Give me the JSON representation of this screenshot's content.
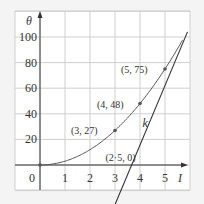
{
  "chart_data": {
    "type": "line",
    "title": "",
    "xlabel": "I",
    "ylabel": "θ",
    "xlim": [
      -1,
      6
    ],
    "ylim": [
      -20,
      120
    ],
    "grid": true,
    "x_ticks": [
      "0",
      "1",
      "2",
      "3",
      "4",
      "5"
    ],
    "y_ticks": [
      "20",
      "40",
      "60",
      "80",
      "100"
    ],
    "series": [
      {
        "name": "curve",
        "kind": "quadratic",
        "x": [
          0,
          3,
          4,
          5
        ],
        "y": [
          0,
          27,
          48,
          75
        ]
      },
      {
        "name": "tangent",
        "kind": "line",
        "x": [
          2.5,
          6.0
        ],
        "y": [
          0,
          104
        ]
      }
    ],
    "annotations": [
      {
        "text": "(3, 27)",
        "x": 3,
        "y": 27
      },
      {
        "text": "(4, 48)",
        "x": 4,
        "y": 48
      },
      {
        "text": "(5, 75)",
        "x": 5,
        "y": 75
      },
      {
        "text": "(2·5, 0)",
        "x": 2.5,
        "y": 0
      },
      {
        "text": "k",
        "x": 4.1,
        "y": 30
      }
    ]
  }
}
